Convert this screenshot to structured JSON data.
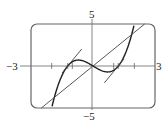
{
  "chart_data": {
    "type": "line",
    "title": "",
    "xlabel": "",
    "ylabel": "",
    "xlim": [
      -3,
      3
    ],
    "ylim": [
      -5,
      5
    ],
    "grid": false,
    "axis_labels": {
      "xmin": "−3",
      "xmax": "3",
      "ymax": "5",
      "ymin": "−5"
    },
    "x_ticks": [
      -2,
      -1.22,
      -1,
      1,
      1.22,
      2
    ],
    "series": [
      {
        "name": "curve f(x) = x^3 - 1.5x",
        "kind": "function",
        "fn": "cubic",
        "a": 1,
        "b": -1.5,
        "domain": [
          -2.05,
          2.05
        ]
      },
      {
        "name": "line y = 2x",
        "kind": "line",
        "slope": 2,
        "x0": 0,
        "y0": 0,
        "domain": [
          -2.5,
          2.5
        ]
      },
      {
        "name": "tangent at left x-intercept",
        "kind": "line",
        "slope": 3,
        "x0": -1.22,
        "y0": 0,
        "domain": [
          -1.5,
          -0.55
        ]
      },
      {
        "name": "tangent at right x-intercept",
        "kind": "line",
        "slope": 3,
        "x0": 1.22,
        "y0": 0,
        "domain": [
          0.55,
          1.5
        ]
      }
    ]
  },
  "colors": {
    "frame": "#555555",
    "axis": "#777777",
    "curve": "#222222",
    "line": "#444444"
  }
}
